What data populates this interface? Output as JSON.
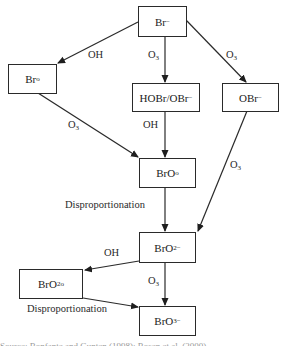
{
  "diagram": {
    "nodes": {
      "br_minus": {
        "base": "Br",
        "sup": "−"
      },
      "br_radical": {
        "base": "Br",
        "sup": "o"
      },
      "hobr_obr": {
        "base": "HOBr/OBr",
        "sup": "−"
      },
      "obr_minus": {
        "base": "OBr",
        "sup": "−"
      },
      "bro_radical": {
        "base": "BrO",
        "sup": "o"
      },
      "bro2_minus": {
        "base": "BrO",
        "sub": "2",
        "sup": "−"
      },
      "bro2_radical": {
        "base": "BrO",
        "sub": "2",
        "sup": "o"
      },
      "bro3_minus": {
        "base": "BrO",
        "sub": "3",
        "sup": "−"
      }
    },
    "edges": [
      {
        "from": "Br−",
        "to": "Br°",
        "label": "OH"
      },
      {
        "from": "Br−",
        "to": "HOBr/OBr−",
        "label": "O3"
      },
      {
        "from": "Br−",
        "to": "OBr−",
        "label": "O3"
      },
      {
        "from": "Br°",
        "to": "BrO°",
        "label": "O3"
      },
      {
        "from": "HOBr/OBr−",
        "to": "BrO°",
        "label": "OH"
      },
      {
        "from": "OBr−",
        "to": "BrO2−",
        "label": "O3"
      },
      {
        "from": "BrO°",
        "to": "BrO2−",
        "label": "Disproportionation"
      },
      {
        "from": "BrO2−",
        "to": "BrO2°",
        "label": "OH"
      },
      {
        "from": "BrO2−",
        "to": "BrO3−",
        "label": "O3"
      },
      {
        "from": "BrO2°",
        "to": "BrO3−",
        "label": "Disproportionation"
      }
    ],
    "labels": {
      "oh": "OH",
      "o": "O",
      "three": "3",
      "disproportionation": "Disproportionation"
    },
    "caption": "Source: Bonfante and Gunten (1998); Rosen et al. (2000)"
  }
}
